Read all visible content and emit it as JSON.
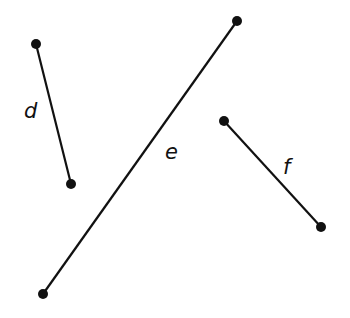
{
  "diagram": {
    "segments": [
      {
        "label": "d",
        "x1": 36,
        "y1": 44,
        "x2": 71,
        "y2": 184,
        "label_x": 24,
        "label_y": 118
      },
      {
        "label": "e",
        "x1": 43,
        "y1": 294,
        "x2": 237,
        "y2": 21,
        "label_x": 165,
        "label_y": 159
      },
      {
        "label": "f",
        "x1": 224,
        "y1": 121,
        "x2": 321,
        "y2": 227,
        "label_x": 283,
        "label_y": 174
      }
    ],
    "colors": {
      "stroke": "#111111",
      "background": "#ffffff"
    }
  }
}
